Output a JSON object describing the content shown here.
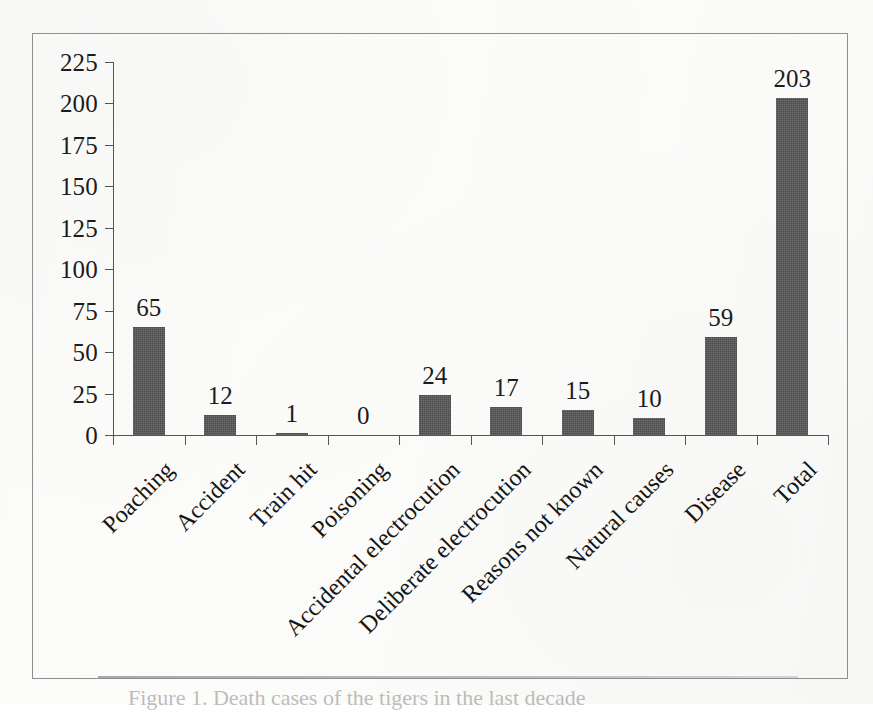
{
  "figure": {
    "caption": "Figure 1. Death cases of the tigers in the last decade",
    "caption_visible_fragment": "Figure 1. Death"
  },
  "chart_data": {
    "type": "bar",
    "title": "",
    "xlabel": "",
    "ylabel": "",
    "categories": [
      "Poaching",
      "Accident",
      "Train hit",
      "Poisoning",
      "Accidental electrocution",
      "Deliberate electrocution",
      "Reasons not known",
      "Natural causes",
      "Disease",
      "Total"
    ],
    "values": [
      65,
      12,
      1,
      0,
      24,
      17,
      15,
      10,
      59,
      203
    ],
    "value_labels": [
      "65",
      "12",
      "1",
      "0",
      "24",
      "17",
      "15",
      "10",
      "59",
      "203"
    ],
    "ylim": [
      0,
      225
    ],
    "ytick_step": 25,
    "ytick_labels": [
      "225",
      "200",
      "175",
      "150",
      "125",
      "100",
      "75",
      "50",
      "25",
      "0"
    ],
    "ytick_values": [
      225,
      200,
      175,
      150,
      125,
      100,
      75,
      50,
      25,
      0
    ],
    "grid": false,
    "legend": false,
    "legend_position": "none",
    "bar_color": "#4b4b4b",
    "axis_color": "#555555",
    "label_rotation_degrees": -45,
    "background_color": "#fcfcfb"
  }
}
